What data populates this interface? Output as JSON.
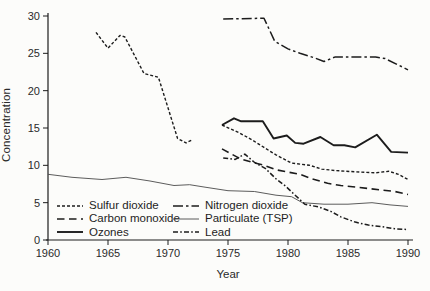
{
  "figure": {
    "background": "#fcfcfa",
    "ink_color": "#1c1c1c",
    "thin_line_color": "#4a4a4a"
  },
  "chart_data": {
    "type": "line",
    "title": "",
    "xlabel": "Year",
    "ylabel": "Concentration",
    "xlim": [
      1960,
      1990
    ],
    "ylim": [
      0,
      30
    ],
    "x_ticks": [
      1960,
      1965,
      1970,
      1975,
      1980,
      1985,
      1990
    ],
    "y_ticks": [
      0,
      5,
      10,
      15,
      20,
      25,
      30
    ],
    "grid": false,
    "legend_position": "bottom-left",
    "legend_columns": 2,
    "series": [
      {
        "name": "Sulfur dioxide",
        "style": "fine-dash",
        "segments": [
          [
            [
              1964,
              27.8
            ],
            [
              1965,
              25.7
            ],
            [
              1966,
              27.4
            ],
            [
              1966.4,
              27.2
            ],
            [
              1968,
              22.3
            ],
            [
              1969.2,
              21.8
            ],
            [
              1970.8,
              13.6
            ],
            [
              1971.5,
              13.0
            ],
            [
              1972,
              13.4
            ]
          ],
          [
            [
              1974.5,
              15.4
            ],
            [
              1976,
              14.3
            ],
            [
              1977,
              13.4
            ],
            [
              1978,
              12.4
            ],
            [
              1979,
              11.4
            ],
            [
              1980.3,
              10.3
            ],
            [
              1981.8,
              10.0
            ],
            [
              1982.8,
              9.5
            ],
            [
              1984,
              9.3
            ],
            [
              1986,
              9.1
            ],
            [
              1987.3,
              9.0
            ],
            [
              1988.4,
              9.2
            ],
            [
              1989.2,
              8.8
            ],
            [
              1990,
              8.1
            ]
          ]
        ]
      },
      {
        "name": "Carbon monoxide",
        "style": "long-dash",
        "segments": [
          [
            [
              1974.5,
              12.2
            ],
            [
              1976,
              10.9
            ],
            [
              1977,
              10.4
            ],
            [
              1978,
              10.0
            ],
            [
              1979,
              9.4
            ],
            [
              1980,
              9.1
            ],
            [
              1981,
              8.8
            ],
            [
              1982,
              8.2
            ],
            [
              1983.3,
              7.6
            ],
            [
              1984.4,
              7.3
            ],
            [
              1985.6,
              7.1
            ],
            [
              1986.7,
              6.9
            ],
            [
              1987.8,
              6.7
            ],
            [
              1988.9,
              6.5
            ],
            [
              1990,
              6.1
            ]
          ]
        ]
      },
      {
        "name": "Ozones",
        "style": "solid-bold",
        "segments": [
          [
            [
              1974.5,
              15.4
            ],
            [
              1975.5,
              16.3
            ],
            [
              1976.1,
              15.9
            ],
            [
              1977.9,
              15.9
            ],
            [
              1978.8,
              13.6
            ],
            [
              1979.9,
              14.0
            ],
            [
              1980.6,
              13.0
            ],
            [
              1981.3,
              12.9
            ],
            [
              1982.7,
              13.8
            ],
            [
              1983.8,
              12.7
            ],
            [
              1984.7,
              12.7
            ],
            [
              1985.6,
              12.4
            ],
            [
              1987.4,
              14.1
            ],
            [
              1988.6,
              11.8
            ],
            [
              1990,
              11.7
            ]
          ]
        ]
      },
      {
        "name": "Nitrogen dioxide",
        "style": "dash-dot",
        "segments": [
          [
            [
              1974.6,
              29.6
            ],
            [
              1978,
              29.7
            ],
            [
              1978.9,
              26.6
            ],
            [
              1980,
              25.6
            ],
            [
              1981,
              25.0
            ],
            [
              1982.2,
              24.4
            ],
            [
              1983,
              23.9
            ],
            [
              1983.9,
              24.5
            ],
            [
              1987.3,
              24.5
            ],
            [
              1988.1,
              24.3
            ],
            [
              1990,
              22.8
            ]
          ]
        ]
      },
      {
        "name": "Particulate (TSP)",
        "style": "solid-thin",
        "segments": [
          [
            [
              1960,
              8.8
            ],
            [
              1962,
              8.4
            ],
            [
              1964.5,
              8.1
            ],
            [
              1966.5,
              8.4
            ],
            [
              1968.5,
              7.9
            ],
            [
              1970.5,
              7.3
            ],
            [
              1971.8,
              7.4
            ],
            [
              1973,
              7.1
            ],
            [
              1975,
              6.6
            ],
            [
              1977.2,
              6.5
            ],
            [
              1979,
              6.0
            ],
            [
              1980.3,
              5.8
            ],
            [
              1981.2,
              5.0
            ],
            [
              1983,
              4.8
            ],
            [
              1985,
              4.8
            ],
            [
              1987,
              5.0
            ],
            [
              1988.5,
              4.7
            ],
            [
              1990,
              4.5
            ]
          ]
        ]
      },
      {
        "name": "Lead",
        "style": "dash-dot-dot",
        "segments": [
          [
            [
              1974.6,
              11.0
            ],
            [
              1975.6,
              10.8
            ],
            [
              1976.4,
              11.5
            ],
            [
              1977.2,
              10.4
            ],
            [
              1978.1,
              9.6
            ],
            [
              1979,
              8.2
            ],
            [
              1979.8,
              7.2
            ],
            [
              1980.6,
              6.0
            ],
            [
              1981.4,
              4.8
            ],
            [
              1982.6,
              4.4
            ],
            [
              1983.6,
              3.8
            ],
            [
              1984.4,
              3.1
            ],
            [
              1985.6,
              2.4
            ],
            [
              1986.7,
              2.0
            ],
            [
              1987.8,
              1.8
            ],
            [
              1988.9,
              1.5
            ],
            [
              1990,
              1.4
            ]
          ]
        ]
      }
    ]
  }
}
